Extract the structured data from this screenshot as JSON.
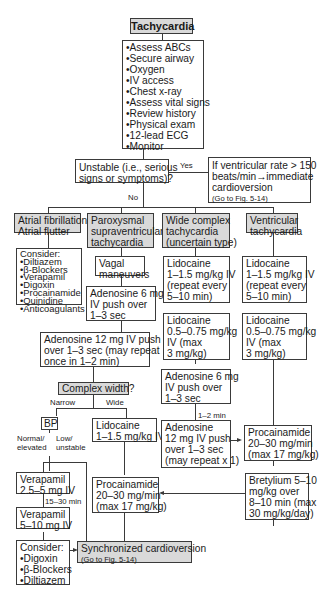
{
  "title": "Tachycardia",
  "assessment": {
    "items": [
      "•Assess ABCs",
      "•Secure airway",
      "•Oxygen",
      "•IV access",
      "•Chest x-ray",
      "•Assess vital signs",
      "•Review history",
      "•Physical exam",
      "•12-lead ECG",
      "•Monitor"
    ]
  },
  "unstable": {
    "question": [
      "Unstable (i.e., serious",
      "signs or symptoms)?"
    ],
    "yes_label": "Yes",
    "no_label": "No",
    "yes_box": [
      "If ventricular rate > 150",
      "beats/min→immediate",
      "cardioversion"
    ],
    "yes_ref": "(Go to Fig. 5-14)"
  },
  "columns": {
    "af": {
      "header": [
        "Atrial fibrillation",
        "Atrial flutter"
      ],
      "consider_title": "Consider:",
      "consider": [
        "•Diltiazem",
        "•β-Blockers",
        "•Verapamil",
        "•Digoxin",
        "•Procainamide",
        "•Quinidine",
        "•Anticoagulants"
      ]
    },
    "psvt": {
      "header": [
        "Paroxysmal",
        "supraventricular",
        "tachycardia"
      ],
      "vagal": [
        "Vagal",
        "maneuvers"
      ],
      "adenosine6": [
        "Adenosine 6 mg",
        "IV push over",
        "1–3 sec"
      ],
      "adenosine12": [
        "Adenosine 12 mg IV push",
        "over 1–3 sec (may repeat",
        "once in 1–2 min)"
      ],
      "complex_width": "Complex width?",
      "narrow_label": "Narrow",
      "wide_label": "Wide",
      "bp": "BP",
      "normal_label": [
        "Normal/",
        "elevated"
      ],
      "low_label": [
        "Low/",
        "unstable"
      ],
      "verapamil1": [
        "Verapamil",
        "2.5–5 mg IV"
      ],
      "interval": "15–30 min",
      "verapamil2": [
        "Verapamil",
        "5–10 mg IV"
      ],
      "consider_title": "Consider:",
      "consider": [
        "•Digoxin",
        "•β-Blockers",
        "•Diltiazem"
      ],
      "lidocaine": [
        "Lidocaine",
        "1–1.5 mg/kg IV"
      ],
      "procainamide": [
        "Procainamide",
        "20–30 mg/min",
        "(max 17 mg/kg)"
      ]
    },
    "wide": {
      "header": [
        "Wide complex",
        "tachycardia",
        "(uncertain type)"
      ],
      "lidocaine1": [
        "Lidocaine",
        "1–1.5 mg/kg IV",
        "(repeat every",
        "5–10 min)"
      ],
      "lidocaine2": [
        "Lidocaine",
        "0.5–0.75 mg/kg",
        "IV (max",
        "3 mg/kg)"
      ],
      "adenosine6": [
        "Adenosine 6 mg",
        "IV push over",
        "1–3 sec"
      ],
      "interval": "1–2 min",
      "adenosine12": [
        "Adenosine",
        "12 mg IV push",
        "over 1–3 sec",
        "(may repeat x 1)"
      ]
    },
    "vt": {
      "header": [
        "Ventricular",
        "tachycardia"
      ],
      "lidocaine1": [
        "Lidocaine",
        "1–1.5 mg/kg IV",
        "(repeat every",
        "5–10 min)"
      ],
      "lidocaine2": [
        "Lidocaine",
        "0.5–0.75 mg/kg",
        "IV (max",
        "3 mg/kg)"
      ],
      "procainamide": [
        "Procainamide",
        "20–30 mg/min",
        "(max 17 mg/kg)"
      ],
      "bretylium": [
        "Bretylium 5–10",
        "mg/kg over",
        "8–10 min (max",
        "30 mg/kg/day)"
      ]
    }
  },
  "cardioversion": {
    "label": "Synchronized cardioversion",
    "ref": "(Go to Fig. 5-14)"
  },
  "colors": {
    "shaded_box": "#d9d9d9",
    "line": "#3a3a3a"
  }
}
